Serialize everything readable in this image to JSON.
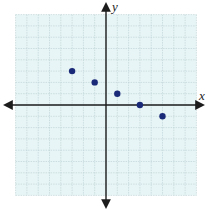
{
  "chart_data": {
    "type": "scatter",
    "title": "",
    "xlabel": "x",
    "ylabel": "y",
    "xlim": [
      -8,
      8
    ],
    "ylim": [
      -8,
      8
    ],
    "grid": true,
    "tick_labels": false,
    "points": [
      {
        "x": -3,
        "y": 3
      },
      {
        "x": -1,
        "y": 2
      },
      {
        "x": 1,
        "y": 1
      },
      {
        "x": 3,
        "y": 0
      },
      {
        "x": 5,
        "y": -1
      }
    ]
  },
  "layout": {
    "origin_px": [
      106,
      105
    ],
    "unit_px": 11.3,
    "grid_bg": "#e8f5f6",
    "grid_line": "#b9cfd2",
    "axis_color": "#1c1c1c",
    "point_color": "#1b2a78"
  }
}
